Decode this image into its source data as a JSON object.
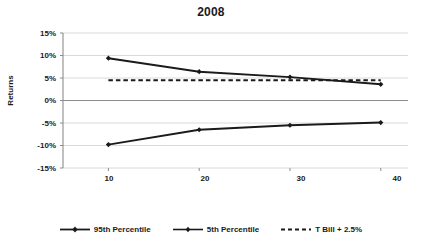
{
  "chart_data": {
    "type": "line",
    "title": "2008",
    "xlabel": "Number of Funds",
    "ylabel": "Returns",
    "x": [
      10,
      20,
      30,
      40
    ],
    "xlim": [
      5,
      43
    ],
    "ylim": [
      -15,
      15
    ],
    "xticks": [
      "10",
      "20",
      "30",
      "40"
    ],
    "yticks": [
      "15%",
      "10%",
      "5%",
      "0%",
      "-5%",
      "-10%",
      "-15%"
    ],
    "ytick_values": [
      15,
      10,
      5,
      0,
      -5,
      -10,
      -15
    ],
    "grid": true,
    "legend_position": "bottom",
    "series": [
      {
        "name": "95th Percentile",
        "values": [
          9.4,
          6.4,
          5.2,
          3.6
        ],
        "style": "solid",
        "color": "#1a1a1a",
        "marker": "diamond"
      },
      {
        "name": "5th Percentile",
        "values": [
          -9.8,
          -6.5,
          -5.5,
          -4.9
        ],
        "style": "solid",
        "color": "#1a1a1a",
        "marker": "diamond"
      },
      {
        "name": "T Bill + 2.5%",
        "values": [
          4.5,
          4.5,
          4.5,
          4.5
        ],
        "style": "dashed",
        "color": "#1a1a1a",
        "marker": "none"
      }
    ]
  },
  "legend": {
    "items": [
      {
        "label": "95th Percentile"
      },
      {
        "label": "5th Percentile"
      },
      {
        "label": "T Bill + 2.5%"
      }
    ]
  },
  "axes": {
    "y_labels": [
      "15%",
      "10%",
      "5%",
      "0%",
      "-5%",
      "-10%",
      "-15%"
    ],
    "x_labels": [
      "10",
      "20",
      "30",
      "40"
    ]
  }
}
